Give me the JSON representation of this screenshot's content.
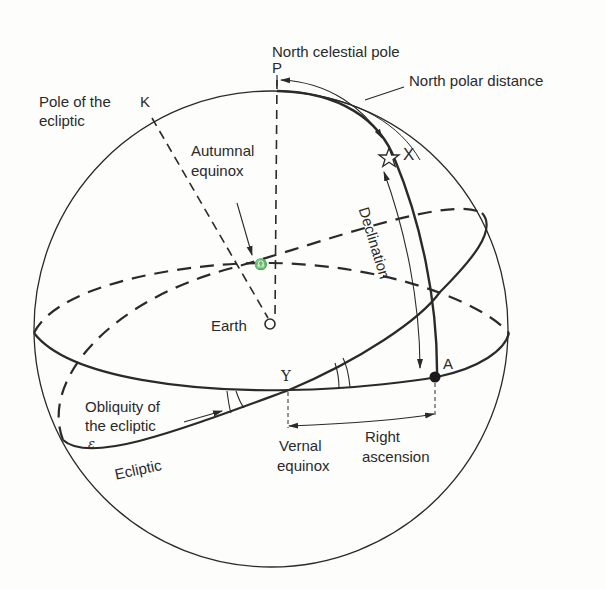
{
  "diagram": {
    "type": "celestial-sphere",
    "labels": {
      "north_celestial_pole": "North celestial pole",
      "pole_P": "P",
      "north_polar_distance": "North polar distance",
      "pole_of_ecliptic_line1": "Pole of the",
      "pole_of_ecliptic_line2": "ecliptic",
      "pole_K": "K",
      "autumnal_line1": "Autumnal",
      "autumnal_line2": "equinox",
      "autumnal_symbol": "♎",
      "star_X": "X",
      "declination": "Declination",
      "earth": "Earth",
      "point_A": "A",
      "vernal_symbol": "Υ",
      "obliquity_line1": "Obliquity of",
      "obliquity_line2": "the ecliptic",
      "epsilon": "ε",
      "ecliptic": "Ecliptic",
      "vernal_line1": "Vernal",
      "vernal_line2": "equinox",
      "right_ascension_line1": "Right",
      "right_ascension_line2": "ascension"
    },
    "colors": {
      "ink": "#2a2a2a",
      "background": "#fdfdfc"
    }
  }
}
